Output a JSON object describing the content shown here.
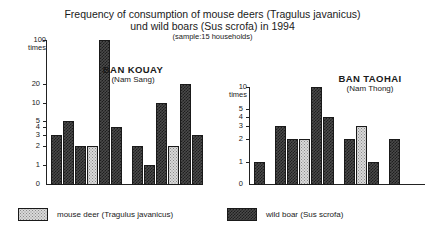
{
  "title": {
    "line1": "Frequency of consumption of mouse deers (Tragulus javanicus)",
    "line2": "und wild boars (Sus scrofa) in 1994",
    "sample": "(sample:15 households)"
  },
  "legend": {
    "deer_label": "mouse deer (Tragulus javanicus)",
    "boar_label": "wild boar (Sus scrofa)",
    "deer_color": "#d9d9d9",
    "boar_color": "#3a3a3a"
  },
  "chart_data": [
    {
      "type": "bar",
      "id": "ban-kouay",
      "title": "BAN KOUAY",
      "subtitle": "(Nam Sang)",
      "ylabel": "100\ntimes",
      "unit_value": "100",
      "unit_word": "times",
      "yscale": "log",
      "ylim": [
        1,
        100
      ],
      "ytick_labels": [
        "1",
        "2",
        "3",
        "4",
        "5",
        "10",
        "20",
        "100"
      ],
      "ytick_values": [
        1,
        2,
        3,
        4,
        5,
        10,
        20,
        100
      ],
      "zero_label": "0",
      "grid": false,
      "legend_position": "bottom",
      "groups": [
        {
          "bars": [
            {
              "series": "wild boar (Sus scrofa)",
              "value": 3
            },
            {
              "series": "wild boar (Sus scrofa)",
              "value": 5
            },
            {
              "series": "wild boar (Sus scrofa)",
              "value": 2
            },
            {
              "series": "mouse deer (Tragulus javanicus)",
              "value": 2
            },
            {
              "series": "wild boar (Sus scrofa)",
              "value": 100
            },
            {
              "series": "wild boar (Sus scrofa)",
              "value": 4
            }
          ]
        },
        {
          "bars": [
            {
              "series": "wild boar (Sus scrofa)",
              "value": 2
            },
            {
              "series": "wild boar (Sus scrofa)",
              "value": 1
            },
            {
              "series": "wild boar (Sus scrofa)",
              "value": 10
            },
            {
              "series": "mouse deer (Tragulus javanicus)",
              "value": 2
            },
            {
              "series": "wild boar (Sus scrofa)",
              "value": 20
            },
            {
              "series": "wild boar (Sus scrofa)",
              "value": 3
            }
          ]
        }
      ]
    },
    {
      "type": "bar",
      "id": "ban-taohai",
      "title": "BAN TAOHAI",
      "subtitle": "(Nam Thong)",
      "unit_value": "10",
      "unit_word": "times",
      "yscale": "log",
      "ylim": [
        1,
        10
      ],
      "ytick_labels": [
        "1",
        "2",
        "3",
        "4",
        "5",
        "10"
      ],
      "ytick_values": [
        1,
        2,
        3,
        4,
        5,
        10
      ],
      "zero_label": "0",
      "grid": false,
      "legend_position": "bottom",
      "groups": [
        {
          "bars": [
            {
              "series": "wild boar (Sus scrofa)",
              "value": 1
            }
          ]
        },
        {
          "bars": [
            {
              "series": "wild boar (Sus scrofa)",
              "value": 3
            },
            {
              "series": "wild boar (Sus scrofa)",
              "value": 2
            },
            {
              "series": "mouse deer (Tragulus javanicus)",
              "value": 2
            },
            {
              "series": "wild boar (Sus scrofa)",
              "value": 10
            },
            {
              "series": "wild boar (Sus scrofa)",
              "value": 4
            }
          ]
        },
        {
          "bars": [
            {
              "series": "wild boar (Sus scrofa)",
              "value": 2
            },
            {
              "series": "mouse deer (Tragulus javanicus)",
              "value": 3
            },
            {
              "series": "wild boar (Sus scrofa)",
              "value": 1
            }
          ]
        },
        {
          "bars": [
            {
              "series": "wild boar (Sus scrofa)",
              "value": 2
            }
          ]
        }
      ]
    }
  ]
}
